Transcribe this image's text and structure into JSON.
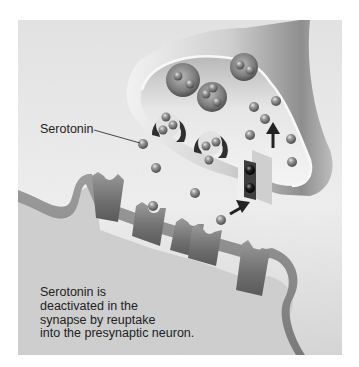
{
  "figure": {
    "background_color": "#d9d9d9",
    "page_color": "#ffffff"
  },
  "labels": {
    "serotonin": "Serotonin"
  },
  "caption": {
    "lines": [
      "Serotonin is",
      "deactivated in the",
      "synapse by reuptake",
      "into the presynaptic neuron."
    ]
  },
  "elements": {
    "presynaptic_neuron": "presynaptic-terminal",
    "postsynaptic_neuron": "postsynaptic-membrane",
    "transporter": "reuptake-transporter",
    "vesicles": 5,
    "receptors": 5
  }
}
